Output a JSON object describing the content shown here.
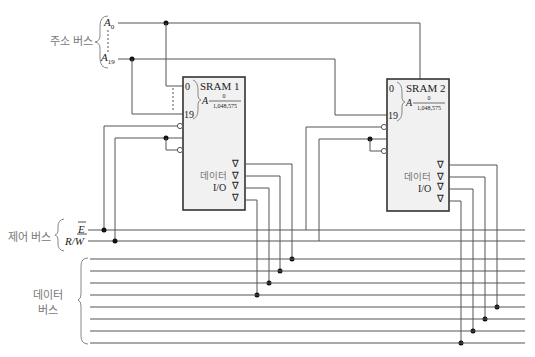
{
  "address_bus": {
    "label": "주소 버스",
    "top_line": "A",
    "top_sub": "0",
    "bottom_line": "A",
    "bottom_sub": "19"
  },
  "control_bus": {
    "label": "제어 버스",
    "enable": "E",
    "rw": "R/W"
  },
  "data_bus": {
    "label_line1": "데이터",
    "label_line2": "버스",
    "line_count": 8
  },
  "sram1": {
    "title": "SRAM 1",
    "addr_start": "0",
    "addr_end": "19",
    "range_letter": "A",
    "range_top": "0",
    "range_bottom": "1,048,575",
    "data_label": "데이터",
    "io_label": "I/O",
    "tri_symbol": "∇"
  },
  "sram2": {
    "title": "SRAM 2",
    "addr_start": "0",
    "addr_end": "19",
    "range_letter": "A",
    "range_top": "0",
    "range_bottom": "1,048,575",
    "data_label": "데이터",
    "io_label": "I/O",
    "tri_symbol": "∇"
  },
  "colors": {
    "wire": "#555555",
    "box_fill": "#f1f1f1",
    "box_stroke": "#333333",
    "label_gray": "#777777"
  }
}
